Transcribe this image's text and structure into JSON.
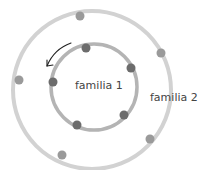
{
  "diagram": {
    "labels": {
      "inner": "familia 1",
      "outer": "familia 2"
    },
    "colors": {
      "background": "#ffffff",
      "outer_ring": "#d2d2d2",
      "inner_ring": "#b4b4b4",
      "outer_dots": "#9a9a9a",
      "inner_dots": "#6c6c6c",
      "arrow": "#222222",
      "text": "#444444"
    },
    "outer_ring": {
      "cx": 92,
      "cy": 90,
      "r": 79
    },
    "inner_ring": {
      "cx": 94,
      "cy": 87,
      "r": 43
    },
    "outer_dots": [
      {
        "x": 80,
        "y": 16
      },
      {
        "x": 161,
        "y": 53
      },
      {
        "x": 19,
        "y": 80
      },
      {
        "x": 150,
        "y": 139
      },
      {
        "x": 62,
        "y": 155
      }
    ],
    "inner_dots": [
      {
        "x": 86,
        "y": 48
      },
      {
        "x": 131,
        "y": 68
      },
      {
        "x": 53,
        "y": 82
      },
      {
        "x": 124,
        "y": 115
      },
      {
        "x": 77,
        "y": 125
      }
    ],
    "arrow": {
      "direction": "counter-clockwise",
      "from": {
        "x": 71,
        "y": 43
      },
      "to": {
        "x": 47,
        "y": 66
      }
    }
  }
}
